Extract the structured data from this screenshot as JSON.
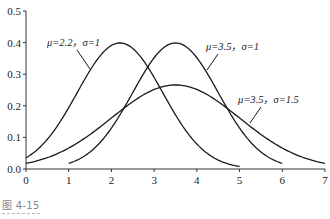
{
  "chart_data": {
    "type": "line",
    "title": "",
    "xlabel": "",
    "ylabel": "",
    "xlim": [
      0,
      7
    ],
    "ylim": [
      0,
      0.5
    ],
    "x_ticks": [
      "0",
      "1",
      "2",
      "3",
      "4",
      "5",
      "6",
      "7"
    ],
    "y_ticks": [
      "0.0",
      "0.1",
      "0.2",
      "0.3",
      "0.4",
      "0.5"
    ],
    "grid": false,
    "legend": "none (inline annotations)",
    "series": [
      {
        "name": "μ=2.2，σ=1",
        "mu": 2.2,
        "sigma": 1,
        "x_range": [
          0,
          5
        ],
        "peak": 0.399,
        "label": "μ=2.2，σ=1"
      },
      {
        "name": "μ=3.5，σ=1",
        "mu": 3.5,
        "sigma": 1,
        "x_range": [
          1,
          6
        ],
        "peak": 0.399,
        "label": "μ=3.5，σ=1"
      },
      {
        "name": "μ=3.5，σ=1.5",
        "mu": 3.5,
        "sigma": 1.5,
        "x_range": [
          0,
          7
        ],
        "peak": 0.266,
        "label": "μ=3.5，σ=1.5"
      }
    ],
    "annotations": [
      {
        "text": "μ=2.2，σ=1",
        "series": 0
      },
      {
        "text": "μ=3.5，σ=1",
        "series": 1
      },
      {
        "text": "μ=3.5，σ=1.5",
        "series": 2
      }
    ]
  },
  "caption": "图 4-15",
  "colors": {
    "line": "#1a1a1a",
    "axis": "#333333",
    "caption": "#888888"
  }
}
